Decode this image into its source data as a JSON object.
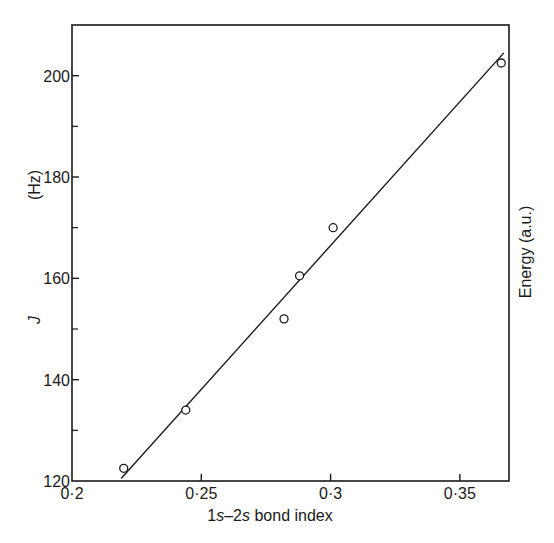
{
  "chart_data": {
    "type": "scatter",
    "title": "",
    "xlabel": "1s–2s bond index",
    "xlabel_parts": [
      {
        "text": "1",
        "italic": false
      },
      {
        "text": "s",
        "italic": true
      },
      {
        "text": "–2",
        "italic": false
      },
      {
        "text": "s",
        "italic": true
      },
      {
        "text": " bond index",
        "italic": false
      }
    ],
    "ylabel": "J (Hz)",
    "ylabel_symbol": "J",
    "ylabel_unit": "(Hz)",
    "y2label": "Energy (a.u.)",
    "xlim": [
      0.2,
      0.369
    ],
    "ylim": [
      120,
      210
    ],
    "grid": false,
    "legend": null,
    "x_ticks": [
      {
        "value": 0.2,
        "label": "0·2"
      },
      {
        "value": 0.25,
        "label": "0·25"
      },
      {
        "value": 0.3,
        "label": "0·3"
      },
      {
        "value": 0.35,
        "label": "0·35"
      }
    ],
    "y_ticks": [
      {
        "value": 120,
        "label": "120"
      },
      {
        "value": 140,
        "label": "140"
      },
      {
        "value": 160,
        "label": "160"
      },
      {
        "value": 180,
        "label": "180"
      },
      {
        "value": 200,
        "label": "200"
      }
    ],
    "y_minor_ticks": [
      130,
      150,
      170,
      190
    ],
    "series": [
      {
        "name": "measured",
        "marker": "open-circle",
        "points": [
          {
            "x": 0.22,
            "y": 122.5
          },
          {
            "x": 0.244,
            "y": 134.0
          },
          {
            "x": 0.282,
            "y": 152.0
          },
          {
            "x": 0.288,
            "y": 160.5
          },
          {
            "x": 0.301,
            "y": 170.0
          },
          {
            "x": 0.366,
            "y": 202.5
          }
        ]
      },
      {
        "name": "fit",
        "type": "line",
        "points": [
          {
            "x": 0.219,
            "y": 120.5
          },
          {
            "x": 0.367,
            "y": 204.5
          }
        ]
      }
    ]
  },
  "labels": {
    "x_title_1": "1",
    "x_title_s1": "s",
    "x_title_2": "–2",
    "x_title_s2": "s",
    "x_title_rest": " bond index",
    "y_symbol": "J",
    "y_unit": "(Hz)",
    "y2_title": "Energy (a.u.)"
  },
  "colors": {
    "ink": "#1a1a1a",
    "background": "#ffffff"
  }
}
